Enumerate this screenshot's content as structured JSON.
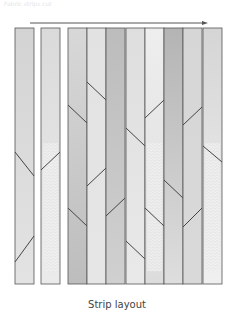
{
  "header": {
    "faint_text": "Fabric strips cut"
  },
  "caption": "Strip layout",
  "arrow": {
    "x1": 30,
    "x2": 208,
    "y": 23,
    "color": "#555555"
  },
  "strips_area": {
    "top": 28,
    "bottom": 284
  },
  "strips": [
    {
      "x": 15,
      "w": 19,
      "top": "#d3d3d3",
      "bottom": "#e3e3e3",
      "cuts": [
        [
          262,
          236
        ],
        [
          152,
          176
        ]
      ],
      "textured": false
    },
    {
      "x": 41,
      "w": 19,
      "top": "#dadada",
      "bottom": "#ebebeb",
      "cuts": [
        [
          170,
          152
        ]
      ],
      "textured": true
    },
    {
      "x": 68,
      "w": 19,
      "top": "#d8d8d8",
      "bottom": "#bdbdbd",
      "cuts": [
        [
          105,
          123
        ],
        [
          208,
          226
        ]
      ],
      "textured": false
    },
    {
      "x": 87,
      "w": 19,
      "top": "#e2e2e2",
      "bottom": "#e6e6e6",
      "cuts": [
        [
          82,
          100
        ],
        [
          186,
          168
        ]
      ],
      "textured": false
    },
    {
      "x": 106,
      "w": 19,
      "top": "#bcbcbc",
      "bottom": "#d0d0d0",
      "cuts": [
        [
          216,
          198
        ]
      ],
      "textured": false
    },
    {
      "x": 126,
      "w": 19,
      "top": "#dedede",
      "bottom": "#e9e9e9",
      "cuts": [
        [
          128,
          146
        ],
        [
          241,
          259
        ]
      ],
      "textured": false
    },
    {
      "x": 145,
      "w": 19,
      "top": "#eeeeee",
      "bottom": "#dcdcdc",
      "cuts": [
        [
          118,
          100
        ],
        [
          208,
          226
        ]
      ],
      "textured": true
    },
    {
      "x": 164,
      "w": 19,
      "top": "#b4b4b4",
      "bottom": "#dedede",
      "cuts": [
        [
          180,
          198
        ]
      ],
      "textured": false
    },
    {
      "x": 183,
      "w": 19,
      "top": "#d6d6d6",
      "bottom": "#d9d9d9",
      "cuts": [
        [
          125,
          107
        ],
        [
          227,
          208
        ]
      ],
      "textured": false
    },
    {
      "x": 203,
      "w": 19,
      "top": "#d5d5d5",
      "bottom": "#f0f0f0",
      "cuts": [
        [
          146,
          162
        ]
      ],
      "textured": true
    }
  ]
}
